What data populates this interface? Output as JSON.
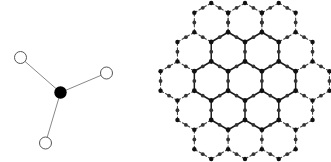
{
  "figure": {
    "width": 331,
    "height": 162,
    "background_color": "#ffffff",
    "caption": "",
    "panels": [
      {
        "id": "panel-left",
        "name": "trigonal-planar-molecule",
        "description": "Single central filled atom bonded to three open-circle ligand atoms in a trigonal planar arrangement"
      },
      {
        "id": "panel-right",
        "name": "honeycomb-lattice",
        "description": "Hexagonal honeycomb lattice network of filled nodes joined by solid and dashed bonds"
      }
    ]
  },
  "colors": {
    "filled_node": "#000000",
    "open_node_stroke": "#555555",
    "open_node_fill": "#ffffff",
    "bond_solid": "#888888",
    "lattice_bond_solid": "#1a1a1a",
    "lattice_bond_dashed": "#444444",
    "lattice_node_major": "#111111",
    "lattice_node_minor": "#333333",
    "background": "#ffffff"
  },
  "molecule": {
    "center_atom": {
      "name": "central-atom",
      "cx": 60.5,
      "cy": 92.5,
      "r": 6.2,
      "style": "filled"
    },
    "ligand_atoms": [
      {
        "name": "ligand-atom-upper-left",
        "cx": 20.5,
        "cy": 57.5,
        "r": 6.0,
        "style": "open"
      },
      {
        "name": "ligand-atom-right",
        "cx": 106.5,
        "cy": 73.0,
        "r": 6.0,
        "style": "open"
      },
      {
        "name": "ligand-atom-bottom",
        "cx": 45.5,
        "cy": 143.0,
        "r": 6.0,
        "style": "open"
      }
    ],
    "bonds": [
      {
        "name": "bond-center-upper-left",
        "x1": 60.5,
        "y1": 92.5,
        "x2": 20.5,
        "y2": 57.5
      },
      {
        "name": "bond-center-right",
        "x1": 60.5,
        "y1": 92.5,
        "x2": 106.5,
        "y2": 73.0
      },
      {
        "name": "bond-center-bottom",
        "x1": 60.5,
        "y1": 92.5,
        "x2": 45.5,
        "y2": 143.0
      }
    ]
  },
  "lattice": {
    "origin_x": 245.0,
    "origin_y": 81.0,
    "cell_radius": 19.5,
    "rings": 2,
    "node_radius_major": 2.4,
    "node_radius_minor": 1.9,
    "solid_stroke_width": 1.5,
    "dashed_stroke_width": 1.1,
    "dash_pattern": "3 2.4",
    "hexagon_count": 19,
    "solid_hexagon_indices": [
      0,
      1,
      2,
      3,
      4,
      5,
      6
    ],
    "description": "Honeycomb of 19 hexagons; inner 7 rendered with solid bonds, outer 12 with dashed bonds; filled circular nodes at all vertices and bond midpoints"
  },
  "chart_data": {
    "type": "diagram",
    "title": "",
    "panels": [
      {
        "label": "trigonal planar unit",
        "nodes": 4,
        "filled_nodes": 1,
        "open_nodes": 3,
        "bonds": 3,
        "coordination_number": 3
      },
      {
        "label": "honeycomb lattice",
        "hexagons": 19,
        "solid_hexagons": 7,
        "dashed_hexagons": 12,
        "rings": 2
      }
    ]
  }
}
